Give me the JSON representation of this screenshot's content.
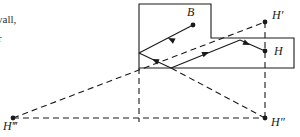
{
  "figure": {
    "kind": "geometric-optics-reflection-diagram",
    "margin_text": {
      "line_1": "vall,",
      "line_2": "r"
    },
    "points": [
      {
        "id": "B",
        "label": "B",
        "x": 193,
        "y": 25,
        "label_x": 187,
        "label_y": 16,
        "dot": true
      },
      {
        "id": "H",
        "label": "H",
        "x": 265,
        "y": 51,
        "label_x": 274,
        "label_y": 55,
        "dot": true
      },
      {
        "id": "Hp",
        "label": "H′",
        "x": 265,
        "y": 22,
        "label_x": 272,
        "label_y": 19,
        "dot": true
      },
      {
        "id": "Hpp",
        "label": "H″",
        "x": 265,
        "y": 118,
        "label_x": 271,
        "label_y": 126,
        "dot": true
      },
      {
        "id": "Hppp",
        "label": "H‴",
        "x": 13,
        "y": 118,
        "label_x": 3,
        "label_y": 130,
        "dot": true
      }
    ],
    "room_outline": {
      "name": "room-walls",
      "path": "M 139 4 L 211 4 L 211 38 L 294 38 L 294 68 L 139 68 Z"
    },
    "rays": [
      {
        "id": "ray-B-to-leftwall",
        "path": "M 193 25 L 139 53",
        "arrows": [
          {
            "x": 168,
            "y": 38,
            "angle": 207
          }
        ]
      },
      {
        "id": "ray-leftwall-to-bottom",
        "path": "M 139 53 L 171 68",
        "arrows": [
          {
            "x": 152,
            "y": 59,
            "angle": 205
          }
        ]
      },
      {
        "id": "ray-bottom-to-corner",
        "path": "M 171 68 L 240 40",
        "arrows": [
          {
            "x": 209,
            "y": 52,
            "angle": 338
          }
        ]
      },
      {
        "id": "ray-corner-to-H",
        "path": "M 240 40 L 265 51",
        "arrows": [
          {
            "x": 250,
            "y": 45,
            "angle": 24
          }
        ]
      }
    ],
    "virtual_lines": [
      {
        "id": "virtual-Hppp-to-Hp",
        "path": "M 13 118 L 265 22"
      },
      {
        "id": "virtual-Hppp-to-Hpp",
        "path": "M 13 118 L 265 118"
      },
      {
        "id": "virtual-Hpp-to-leftwall",
        "path": "M 265 118 L 171 68"
      },
      {
        "id": "virtual-Hp-vertical",
        "path": "M 265 22 L 265 122"
      },
      {
        "id": "virtual-leftwall-down",
        "path": "M 139 68 L 139 122"
      }
    ],
    "colors": {
      "ink": "#1a1a1a",
      "background": "#ffffff"
    }
  }
}
